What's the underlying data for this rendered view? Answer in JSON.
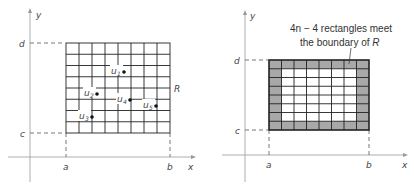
{
  "left_figure": {
    "axis_labels": {
      "x": "x",
      "y": "y"
    },
    "tick_labels": {
      "a": "a",
      "b": "b",
      "c": "c",
      "d": "d"
    },
    "region_label": "R",
    "grid": {
      "rows": 8,
      "cols": 8
    },
    "points": [
      {
        "label": "u",
        "sub": "1"
      },
      {
        "label": "u",
        "sub": "2"
      },
      {
        "label": "u",
        "sub": "3"
      },
      {
        "label": "u",
        "sub": "4"
      },
      {
        "label": "u",
        "sub": "5"
      }
    ]
  },
  "right_figure": {
    "axis_labels": {
      "x": "x",
      "y": "y"
    },
    "tick_labels": {
      "a": "a",
      "b": "b",
      "c": "c",
      "d": "d"
    },
    "grid": {
      "rows": 8,
      "cols": 8
    },
    "annotation_line1": "4n − 4 rectangles meet",
    "annotation_line2_prefix": "the boundary of ",
    "annotation_line2_region": "R",
    "boundary_fill": "#a8a8a8"
  }
}
